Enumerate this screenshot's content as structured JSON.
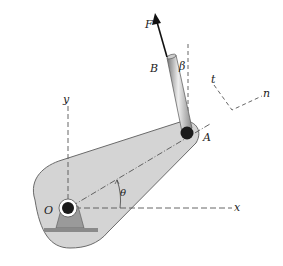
{
  "figure": {
    "labels": {
      "force": "F",
      "point_b": "B",
      "angle_beta": "β",
      "axis_t": "t",
      "axis_n": "n",
      "axis_y": "y",
      "point_a": "A",
      "point_o": "O",
      "angle_theta": "θ",
      "axis_x": "x"
    },
    "colors": {
      "lever_fill": "#d4d4d4",
      "lever_edge": "#6a6a6a",
      "pin": "#1a1a1a",
      "bracket": "#9a9a9a",
      "rod": "#b8b8b8",
      "dash": "#555555"
    }
  }
}
